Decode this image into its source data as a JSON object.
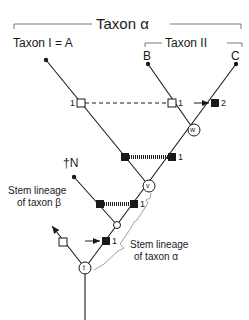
{
  "diagram": {
    "type": "phylogenetic-tree",
    "title": "Taxon α",
    "group_labels": {
      "taxon_alpha": "Taxon α",
      "taxon_one": "Taxon I = A",
      "taxon_two": "Taxon II"
    },
    "terminals": {
      "b": "B",
      "c": "C",
      "n": "†N"
    },
    "node_labels": {
      "w": "w",
      "v": "v",
      "t": "t"
    },
    "character_numbers": {
      "open_left": "1",
      "open_right": "1",
      "filled_c": "2",
      "filled_upper": "1",
      "filled_lower": "1",
      "filled_stem": "1"
    },
    "annotations": {
      "stem_beta_line1": "Stem lineage",
      "stem_beta_line2": "of taxon β",
      "stem_alpha_line1": "Stem lineage",
      "stem_alpha_line2": "of taxon α"
    },
    "colors": {
      "line": "#1a1a1a",
      "bracket": "#888888",
      "background": "#ffffff"
    }
  }
}
